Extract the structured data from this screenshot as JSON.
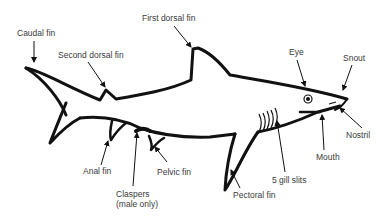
{
  "diagram": {
    "labels": [
      {
        "id": "caudal_fin",
        "text": "Caudal fin",
        "x": 17,
        "y": 28
      },
      {
        "id": "second_dorsal_fin",
        "text": "Second dorsal fin",
        "x": 58,
        "y": 50
      },
      {
        "id": "first_dorsal_fin",
        "text": "First dorsal fin",
        "x": 142,
        "y": 13
      },
      {
        "id": "eye",
        "text": "Eye",
        "x": 289,
        "y": 47
      },
      {
        "id": "snout",
        "text": "Snout",
        "x": 343,
        "y": 53
      },
      {
        "id": "nostril",
        "text": "Nostril",
        "x": 346,
        "y": 130
      },
      {
        "id": "mouth",
        "text": "Mouth",
        "x": 316,
        "y": 152
      },
      {
        "id": "gill_slits",
        "text": "5 gill slits",
        "x": 272,
        "y": 175
      },
      {
        "id": "pectoral_fin",
        "text": "Pectoral fin",
        "x": 233,
        "y": 190
      },
      {
        "id": "pelvic_fin",
        "text": "Pelvic fin",
        "x": 157,
        "y": 167
      },
      {
        "id": "anal_fin",
        "text": "Anal fin",
        "x": 83,
        "y": 166
      },
      {
        "id": "claspers_line1",
        "text": "Claspers",
        "x": 116,
        "y": 189
      },
      {
        "id": "claspers_line2",
        "text": "(male only)",
        "x": 116,
        "y": 199
      }
    ]
  },
  "colors": {
    "outline": "#111111",
    "label": "#3a3a3a",
    "background": "#ffffff"
  }
}
